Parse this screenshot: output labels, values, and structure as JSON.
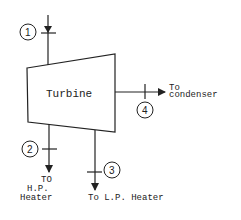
{
  "diagram": {
    "turbine_label": "Turbine",
    "streams": [
      {
        "id": "1",
        "label": "1",
        "description": "Inlet"
      },
      {
        "id": "2",
        "label": "2",
        "destination_lines": [
          "TO",
          "H.P.",
          "Heater"
        ]
      },
      {
        "id": "3",
        "label": "3",
        "destination": "To L.P. Heater"
      },
      {
        "id": "4",
        "label": "4",
        "destination_lines": [
          "To",
          "condenser"
        ]
      }
    ]
  }
}
